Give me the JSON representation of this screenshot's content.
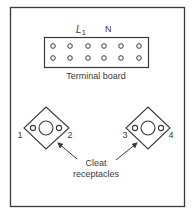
{
  "diagram": {
    "terminal_board": {
      "label": "Terminal board",
      "top_labels": {
        "l1_main": "L",
        "l1_sub": "1",
        "n": "N"
      },
      "rows": 2,
      "columns": 6
    },
    "cleat_receptacles": {
      "label_line1": "Cleat",
      "label_line2": "receptacles",
      "left": {
        "terminal_a": "1",
        "terminal_b": "2"
      },
      "right": {
        "terminal_a": "3",
        "terminal_b": "4"
      }
    },
    "colors": {
      "line": "#3a3a3a",
      "background": "#ffffff"
    }
  }
}
